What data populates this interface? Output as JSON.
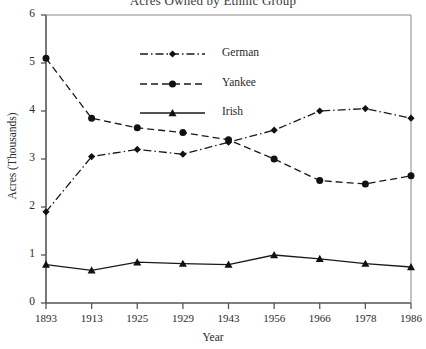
{
  "chart_data": {
    "type": "line",
    "title": "Acres Owned by Ethnic Group",
    "xlabel": "Year",
    "ylabel": "Acres (Thousands)",
    "categories": [
      "1893",
      "1913",
      "1925",
      "1929",
      "1943",
      "1956",
      "1966",
      "1978",
      "1986"
    ],
    "ylim": [
      0,
      6
    ],
    "yticks": [
      "0",
      "1",
      "2",
      "3",
      "4",
      "5",
      "6"
    ],
    "grid": false,
    "legend_position": "upper-center",
    "series": [
      {
        "name": "German",
        "marker": "diamond",
        "line_style": "dash-dot",
        "color": "#1a1a1a",
        "values": [
          1.9,
          3.05,
          3.2,
          3.1,
          3.35,
          3.6,
          4.0,
          4.05,
          3.85
        ]
      },
      {
        "name": "Yankee",
        "marker": "circle",
        "line_style": "dashed",
        "color": "#1a1a1a",
        "values": [
          5.1,
          3.85,
          3.65,
          3.55,
          3.4,
          3.0,
          2.55,
          2.48,
          2.65
        ]
      },
      {
        "name": "Irish",
        "marker": "triangle",
        "line_style": "solid",
        "color": "#1a1a1a",
        "values": [
          0.8,
          0.68,
          0.85,
          0.82,
          0.8,
          1.0,
          0.92,
          0.82,
          0.75
        ]
      }
    ]
  },
  "legend": {
    "entries": [
      {
        "label": "German"
      },
      {
        "label": "Yankee"
      },
      {
        "label": "Irish"
      }
    ]
  }
}
